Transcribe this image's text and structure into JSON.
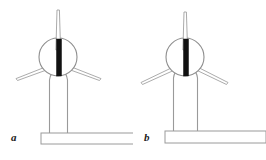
{
  "figure": {
    "type": "technical-line-diagram",
    "background_color": "#ffffff",
    "stroke_color": "#9a9a9a",
    "stroke_color_dark": "#6e6e6e",
    "fill_color": "#ffffff",
    "accent_color": "#111111",
    "label_color": "#1a1a1a",
    "panel_count": 2
  },
  "panels": [
    {
      "id": "a",
      "label": "a",
      "description": "Wind turbine with narrow tapered tower and hub rotor bar offset left of centre",
      "parts": {
        "mast_label": "vertical mast",
        "hub_label": "hub circle",
        "rotor_bar_label": "rotor blade bar",
        "arm_left_label": "lower left arm",
        "arm_right_label": "lower right arm",
        "tower_label": "tower",
        "foundation_label": "foundation slab"
      },
      "geometry": {
        "hub_center_x": 58,
        "hub_center_y": 57,
        "hub_radius": 19,
        "rotor_bar_x": 57,
        "rotor_bar_top": 39,
        "rotor_bar_bottom": 76,
        "rotor_bar_width": 5,
        "mast_top_y": 10,
        "mast_top_width": 2.4,
        "mast_bottom_width": 4.6,
        "arm_left_tip_x": 16,
        "arm_left_tip_y": 80,
        "arm_right_tip_x": 101,
        "arm_right_tip_y": 80,
        "tower_left_x": 49,
        "tower_right_x": 68,
        "tower_top_y": 72,
        "tower_bottom_y": 133,
        "foundation_x": 41,
        "foundation_y": 133,
        "foundation_width": 92,
        "foundation_height": 11
      }
    },
    {
      "id": "b",
      "label": "b",
      "description": "Wind turbine with wider straight tower and hub rotor bar centred on hub",
      "parts": {
        "mast_label": "vertical mast",
        "hub_label": "hub circle",
        "rotor_bar_label": "rotor blade bar",
        "arm_left_label": "lower left arm",
        "arm_right_label": "lower right arm",
        "tower_label": "tower",
        "foundation_label": "foundation slab"
      },
      "geometry": {
        "hub_center_x": 52,
        "hub_center_y": 57,
        "hub_radius": 19,
        "rotor_bar_x": 51,
        "rotor_bar_top": 39,
        "rotor_bar_bottom": 76,
        "rotor_bar_width": 5,
        "mast_top_y": 12,
        "mast_top_width": 2.4,
        "mast_bottom_width": 4.6,
        "arm_left_tip_x": 8,
        "arm_left_tip_y": 84,
        "arm_right_tip_x": 95,
        "arm_right_tip_y": 84,
        "tower_left_x": 40,
        "tower_right_x": 65,
        "tower_top_y": 72,
        "tower_bottom_y": 133,
        "foundation_x": 32,
        "foundation_y": 131,
        "foundation_width": 101,
        "foundation_height": 12
      }
    }
  ]
}
